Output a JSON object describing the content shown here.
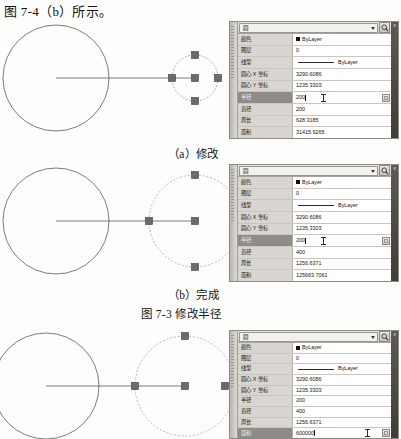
{
  "document": {
    "heading": "图 7-4（b）所示。"
  },
  "figure": {
    "title": "图 7-3  修改半径",
    "captions": [
      "（a）修改",
      "（b）完成"
    ]
  },
  "palette": {
    "object_type": "圆",
    "close_label_chars": [
      "X",
      "属",
      "性"
    ],
    "quick_select_icon": "quick-select-icon",
    "labels": {
      "color": "颜色",
      "layer": "图层",
      "linetype": "线型",
      "center_x": "圆心 X 坐标",
      "center_y": "圆心 Y 坐标",
      "radius": "半径",
      "diameter": "直径",
      "circumference": "周长",
      "area": "面积"
    }
  },
  "panels": [
    {
      "id": "panel-a",
      "caption": "（a）修改",
      "rows": [
        {
          "label": "颜色",
          "value": "ByLayer",
          "kind": "color",
          "selected": false
        },
        {
          "label": "图层",
          "value": "0",
          "kind": "text",
          "selected": false
        },
        {
          "label": "线型",
          "value": "ByLayer",
          "kind": "linetype",
          "selected": false
        },
        {
          "label": "圆心 X 坐标",
          "value": "3290.6086",
          "kind": "text",
          "selected": false
        },
        {
          "label": "圆心 Y 坐标",
          "value": "1235.3303",
          "kind": "text",
          "selected": false
        },
        {
          "label": "半径",
          "value": "200",
          "kind": "editing",
          "selected": true
        },
        {
          "label": "直径",
          "value": "200",
          "kind": "text",
          "selected": false
        },
        {
          "label": "周长",
          "value": "628.3185",
          "kind": "text",
          "selected": false
        },
        {
          "label": "面积",
          "value": "31415.9265",
          "kind": "text",
          "selected": false
        }
      ],
      "drawing": {
        "solid_circle_r": 53,
        "dashed_circle_r": 23,
        "grips": 5
      }
    },
    {
      "id": "panel-b",
      "caption": "（b）完成",
      "rows": [
        {
          "label": "颜色",
          "value": "ByLayer",
          "kind": "color",
          "selected": false
        },
        {
          "label": "图层",
          "value": "0",
          "kind": "text",
          "selected": false
        },
        {
          "label": "线型",
          "value": "ByLayer",
          "kind": "linetype",
          "selected": false
        },
        {
          "label": "圆心 X 坐标",
          "value": "3290.6086",
          "kind": "text",
          "selected": false
        },
        {
          "label": "圆心 Y 坐标",
          "value": "1235.3303",
          "kind": "text",
          "selected": false
        },
        {
          "label": "半径",
          "value": "200",
          "kind": "editing",
          "selected": true
        },
        {
          "label": "直径",
          "value": "400",
          "kind": "text",
          "selected": false
        },
        {
          "label": "周长",
          "value": "1256.6371",
          "kind": "text",
          "selected": false
        },
        {
          "label": "面积",
          "value": "125663.7061",
          "kind": "text",
          "selected": false
        }
      ],
      "drawing": {
        "solid_circle_r": 53,
        "dashed_circle_r": 46,
        "grips": 4
      }
    },
    {
      "id": "panel-c",
      "caption": "",
      "rows": [
        {
          "label": "颜色",
          "value": "ByLayer",
          "kind": "color",
          "selected": false
        },
        {
          "label": "图层",
          "value": "0",
          "kind": "text",
          "selected": false
        },
        {
          "label": "线型",
          "value": "ByLayer",
          "kind": "linetype",
          "selected": false
        },
        {
          "label": "圆心 X 坐标",
          "value": "3290.6086",
          "kind": "text",
          "selected": false
        },
        {
          "label": "圆心 Y 坐标",
          "value": "1235.3303",
          "kind": "text",
          "selected": false
        },
        {
          "label": "半径",
          "value": "200",
          "kind": "text",
          "selected": false
        },
        {
          "label": "直径",
          "value": "400",
          "kind": "text",
          "selected": false
        },
        {
          "label": "周长",
          "value": "1256.6371",
          "kind": "text",
          "selected": false
        },
        {
          "label": "面积",
          "value": "600000",
          "kind": "editing",
          "selected": true
        }
      ],
      "drawing": {
        "solid_circle_r": 53,
        "dashed_circle_r": 50,
        "grips": 3
      }
    }
  ]
}
